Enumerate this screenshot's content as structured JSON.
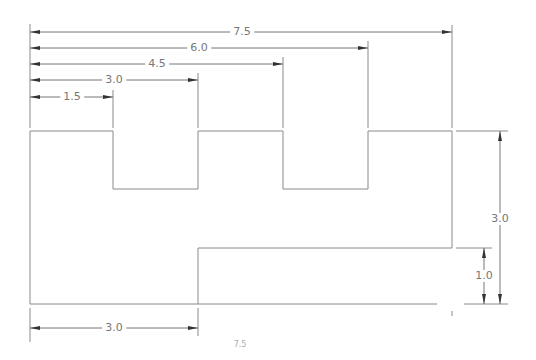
{
  "drawing": {
    "title": "Stepped notched profile with dimensions",
    "stroke_color": "#8a8a8a",
    "text_color": "#777777",
    "horizontal_dimensions_top": [
      {
        "label": "7.5",
        "value": 7.5
      },
      {
        "label": "6.0",
        "value": 6.0
      },
      {
        "label": "4.5",
        "value": 4.5
      },
      {
        "label": "3.0",
        "value": 3.0
      },
      {
        "label": "1.5",
        "value": 1.5
      }
    ],
    "horizontal_dimensions_bottom": [
      {
        "label": "3.0",
        "value": 3.0
      },
      {
        "label": "7.5",
        "value": 7.5,
        "note": "partially cut off"
      }
    ],
    "vertical_dimensions_right": [
      {
        "label": "3.0",
        "value": 3.0
      },
      {
        "label": "1.0",
        "value": 1.0
      }
    ]
  }
}
